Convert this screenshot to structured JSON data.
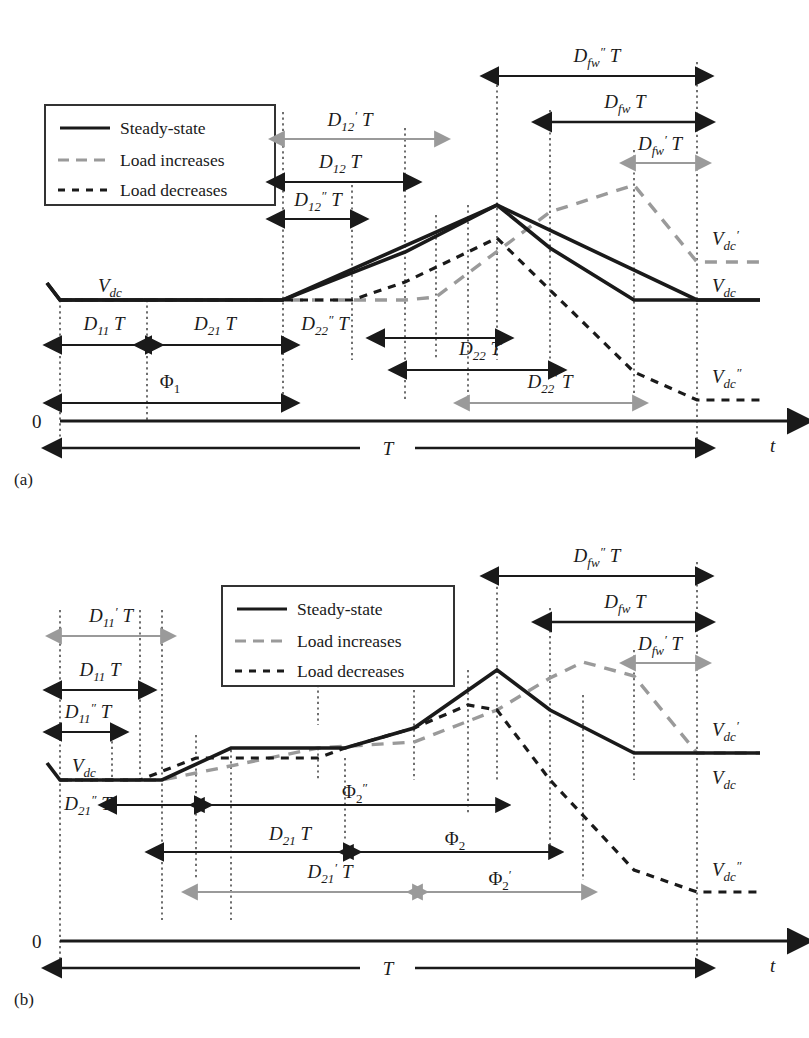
{
  "figure": {
    "type": "timing-waveform-diagram",
    "panels": [
      {
        "id": "a",
        "label": "(a)",
        "legend": {
          "items": [
            {
              "label": "Steady-state",
              "style": "solid",
              "color": "#1a1a1a"
            },
            {
              "label": "Load increases",
              "style": "dashed-long",
              "color": "#9a9a9a"
            },
            {
              "label": "Load decreases",
              "style": "dashed-short",
              "color": "#1a1a1a"
            }
          ]
        },
        "axis": {
          "origin_label": "0",
          "time_label": "t",
          "period_label": "T"
        },
        "voltage_labels": [
          {
            "text": "V′dc",
            "tex": "V'_{dc}",
            "color": "#9a9a9a",
            "side": "right"
          },
          {
            "text": "Vdc",
            "tex": "V_{dc}",
            "color": "#1a1a1a",
            "side": "right"
          },
          {
            "text": "V″dc",
            "tex": "V''_{dc}",
            "color": "#1a1a1a",
            "side": "right"
          },
          {
            "text": "Vdc",
            "tex": "V_{dc}",
            "color": "#1a1a1a",
            "side": "left"
          }
        ],
        "intervals": [
          {
            "tex": "D'_{12}T",
            "base": "D",
            "sub": "12",
            "prime": "′",
            "color": "#9a9a9a"
          },
          {
            "tex": "D_{12}T",
            "base": "D",
            "sub": "12",
            "prime": "",
            "color": "#1a1a1a"
          },
          {
            "tex": "D''_{12}T",
            "base": "D",
            "sub": "12",
            "prime": "″",
            "color": "#1a1a1a"
          },
          {
            "tex": "D''_{fw}T",
            "base": "D",
            "sub": "fw",
            "prime": "″",
            "color": "#1a1a1a"
          },
          {
            "tex": "D_{fw}T",
            "base": "D",
            "sub": "fw",
            "prime": "",
            "color": "#1a1a1a"
          },
          {
            "tex": "D'_{fw}T",
            "base": "D",
            "sub": "fw",
            "prime": "′",
            "color": "#9a9a9a"
          },
          {
            "tex": "D_{11}T",
            "base": "D",
            "sub": "11",
            "prime": "",
            "color": "#1a1a1a"
          },
          {
            "tex": "D_{21}T",
            "base": "D",
            "sub": "21",
            "prime": "",
            "color": "#1a1a1a"
          },
          {
            "tex": "D''_{22}T",
            "base": "D",
            "sub": "22",
            "prime": "″",
            "color": "#1a1a1a"
          },
          {
            "tex": "D_{22}T",
            "base": "D",
            "sub": "22",
            "prime": "",
            "color": "#1a1a1a"
          },
          {
            "tex": "D'_{22}T",
            "base": "D",
            "sub": "22",
            "prime": "′",
            "color": "#9a9a9a"
          },
          {
            "tex": "\\Phi_1",
            "base": "Φ",
            "sub": "1",
            "prime": "",
            "color": "#1a1a1a"
          }
        ]
      },
      {
        "id": "b",
        "label": "(b)",
        "legend": {
          "items": [
            {
              "label": "Steady-state",
              "style": "solid",
              "color": "#1a1a1a"
            },
            {
              "label": "Load increases",
              "style": "dashed-long",
              "color": "#9a9a9a"
            },
            {
              "label": "Load decreases",
              "style": "dashed-short",
              "color": "#1a1a1a"
            }
          ]
        },
        "axis": {
          "origin_label": "0",
          "time_label": "t",
          "period_label": "T"
        },
        "voltage_labels": [
          {
            "text": "V′dc",
            "tex": "V'_{dc}",
            "color": "#9a9a9a",
            "side": "right"
          },
          {
            "text": "Vdc",
            "tex": "V_{dc}",
            "color": "#1a1a1a",
            "side": "right"
          },
          {
            "text": "V″dc",
            "tex": "V''_{dc}",
            "color": "#1a1a1a",
            "side": "right"
          },
          {
            "text": "Vdc",
            "tex": "V_{dc}",
            "color": "#1a1a1a",
            "side": "left"
          }
        ],
        "intervals": [
          {
            "tex": "D'_{11}T",
            "base": "D",
            "sub": "11",
            "prime": "′",
            "color": "#9a9a9a"
          },
          {
            "tex": "D_{11}T",
            "base": "D",
            "sub": "11",
            "prime": "",
            "color": "#1a1a1a"
          },
          {
            "tex": "D''_{11}T",
            "base": "D",
            "sub": "11",
            "prime": "″",
            "color": "#1a1a1a"
          },
          {
            "tex": "D''_{21}T",
            "base": "D",
            "sub": "21",
            "prime": "″",
            "color": "#1a1a1a"
          },
          {
            "tex": "D_{21}T",
            "base": "D",
            "sub": "21",
            "prime": "",
            "color": "#1a1a1a"
          },
          {
            "tex": "D'_{21}T",
            "base": "D",
            "sub": "21",
            "prime": "′",
            "color": "#9a9a9a"
          },
          {
            "tex": "D''_{fw}T",
            "base": "D",
            "sub": "fw",
            "prime": "″",
            "color": "#1a1a1a"
          },
          {
            "tex": "D_{fw}T",
            "base": "D",
            "sub": "fw",
            "prime": "",
            "color": "#1a1a1a"
          },
          {
            "tex": "D'_{fw}T",
            "base": "D",
            "sub": "fw",
            "prime": "′",
            "color": "#9a9a9a"
          },
          {
            "tex": "\\Phi''_2",
            "base": "Φ",
            "sub": "2",
            "prime": "″",
            "color": "#1a1a1a"
          },
          {
            "tex": "\\Phi_2",
            "base": "Φ",
            "sub": "2",
            "prime": "",
            "color": "#1a1a1a"
          },
          {
            "tex": "\\Phi'_2",
            "base": "Φ",
            "sub": "2",
            "prime": "′",
            "color": "#9a9a9a"
          }
        ]
      }
    ],
    "colors": {
      "steady": "#1a1a1a",
      "increase": "#9a9a9a",
      "decrease": "#1a1a1a",
      "guide": "#333333",
      "background": "#ffffff"
    }
  },
  "panel_a": {
    "label": "(a)",
    "legend": {
      "steady": "Steady-state",
      "increase": "Load increases",
      "decrease": "Load decreases"
    },
    "axis": {
      "zero": "0",
      "t": "t",
      "T": "T"
    },
    "labels": {
      "d12_prime": "T",
      "d12": "T",
      "d12_dprime": "T",
      "dfw_dprime": "T",
      "dfw": "T",
      "dfw_prime": "T",
      "d11": "T",
      "d21": "T",
      "d22_dprime": "T",
      "d22": "T",
      "d22_prime": "T",
      "vdc_left": "V",
      "vdc_right": "V",
      "vdc_up": "V",
      "vdc_down": "V"
    }
  },
  "panel_b": {
    "label": "(b)",
    "legend": {
      "steady": "Steady-state",
      "increase": "Load increases",
      "decrease": "Load decreases"
    },
    "axis": {
      "zero": "0",
      "t": "t",
      "T": "T"
    }
  }
}
